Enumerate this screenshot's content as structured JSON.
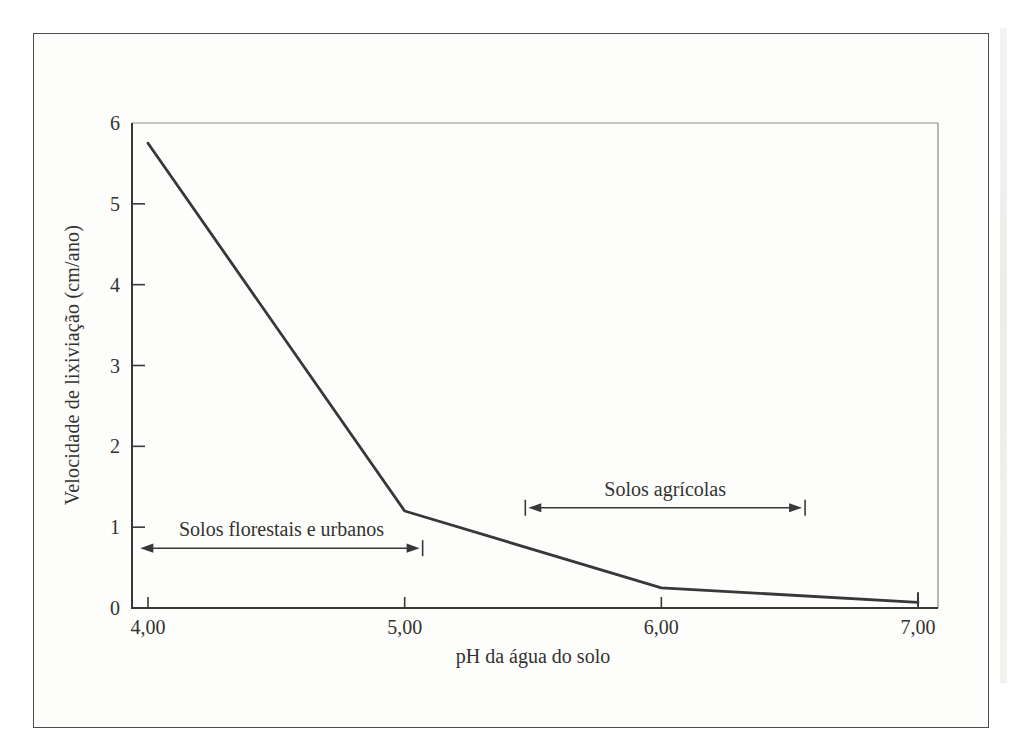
{
  "figure": {
    "background": "#fdfdfb",
    "border_color": "#4d4d4d",
    "ink_color": "#383838"
  },
  "chart_data": {
    "type": "line",
    "title": "",
    "xlabel": "pH da água do solo",
    "ylabel": "Velocidade de lixiviação (cm/ano)",
    "xlim": [
      4.0,
      7.0
    ],
    "ylim": [
      0,
      6
    ],
    "grid": false,
    "legend": null,
    "x_ticks": [
      {
        "value": 4.0,
        "label": "4,00"
      },
      {
        "value": 5.0,
        "label": "5,00"
      },
      {
        "value": 6.0,
        "label": "6,00"
      },
      {
        "value": 7.0,
        "label": "7,00"
      }
    ],
    "y_ticks": [
      {
        "value": 0,
        "label": "0"
      },
      {
        "value": 1,
        "label": "1"
      },
      {
        "value": 2,
        "label": "2"
      },
      {
        "value": 3,
        "label": "3"
      },
      {
        "value": 4,
        "label": "4"
      },
      {
        "value": 5,
        "label": "5"
      },
      {
        "value": 6,
        "label": "6"
      }
    ],
    "series": [
      {
        "name": "Velocidade de lixiviação vs pH",
        "color": "#383838",
        "points": [
          [
            4.0,
            5.75
          ],
          [
            5.0,
            1.2
          ],
          [
            6.0,
            0.25
          ],
          [
            7.0,
            0.07
          ]
        ],
        "end_cap": "bar"
      }
    ],
    "annotations": [
      {
        "label": "Solos florestais e urbanos",
        "x_from": 3.97,
        "x_to": 5.07,
        "y": 0.74,
        "left_cap": "arrow",
        "right_cap": "arrow+bar"
      },
      {
        "label": "Solos agrícolas",
        "x_from": 5.47,
        "x_to": 6.56,
        "y": 1.24,
        "left_cap": "arrow+bar",
        "right_cap": "arrow+bar"
      }
    ]
  }
}
